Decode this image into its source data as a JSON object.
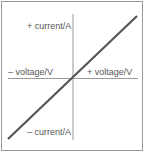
{
  "diagram": {
    "type": "current-voltage graph (ohmic conductor)",
    "labels": {
      "y_positive": "+ current/A",
      "y_negative": "– current/A",
      "x_negative": "– voltage/V",
      "x_positive": "+ voltage/V"
    },
    "line": {
      "description": "straight line through origin",
      "color": "#555555"
    },
    "axis_color": "#9a9a9a"
  }
}
